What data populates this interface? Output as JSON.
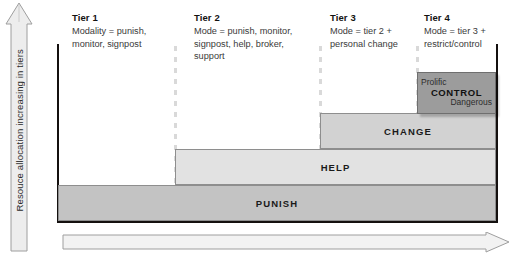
{
  "figure": {
    "type": "tiered-intervention-pyramid-diagram",
    "y_axis_label": "Resouce allocation increasing in tiers",
    "x_axis_label": "",
    "y_axis_icon": "up-arrow-icon",
    "x_axis_icon": "right-arrow-icon"
  },
  "tiers": [
    {
      "id": "tier-1",
      "title": "Tier 1",
      "description": "Modality = punish, monitor, signpost"
    },
    {
      "id": "tier-2",
      "title": "Tier 2",
      "description": "Mode = punish, monitor, signpost, help, broker, support"
    },
    {
      "id": "tier-3",
      "title": "Tier 3",
      "description": "Mode = tier 2 + personal change"
    },
    {
      "id": "tier-4",
      "title": "Tier 4",
      "description": "Mode = tier 3 + restrict/control"
    }
  ],
  "bands": [
    {
      "id": "punish",
      "label": "PUNISH",
      "fill": "#c3c3c3",
      "tier_span": "1-4"
    },
    {
      "id": "help",
      "label": "HELP",
      "fill": "#e2e2e2",
      "tier_span": "2-4"
    },
    {
      "id": "change",
      "label": "CHANGE",
      "fill": "#d2d2d2",
      "tier_span": "3-4"
    }
  ],
  "control_block": {
    "top_label": "Prolific",
    "main_label": "CONTROL",
    "bottom_label": "Dangerous",
    "fill": "#9c9c9c",
    "tier_span": "4"
  },
  "colors": {
    "frame": "#14100f",
    "divider": "#d9d9d9",
    "band_border": "#8e8e8e",
    "text": "#2b2b2b",
    "arrow_fill": "#eeeeee",
    "arrow_stroke": "#9a9a9a"
  }
}
